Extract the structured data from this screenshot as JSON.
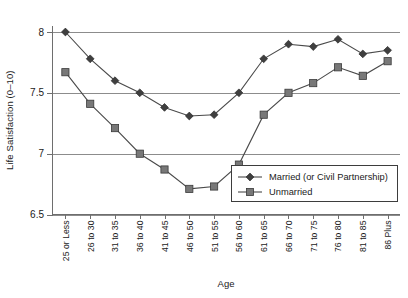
{
  "chart_data": {
    "type": "line",
    "title": "",
    "xlabel": "Age",
    "ylabel": "Life Satisfaction (0–10)",
    "categories": [
      "25 or Less",
      "26 to 30",
      "31 to 35",
      "36 to 40",
      "41 to 45",
      "46 to 50",
      "51 to 55",
      "56 to 60",
      "61 to 65",
      "66 to 70",
      "71 to 75",
      "76 to 80",
      "81 to 85",
      "86 Plus"
    ],
    "ylim": [
      6.5,
      8.0
    ],
    "yticks": [
      6.5,
      7,
      7.5,
      8
    ],
    "ytick_labels": [
      "6.5",
      "7",
      "7.5",
      "8"
    ],
    "grid": true,
    "legend_position": "bottom-right",
    "series": [
      {
        "name": "Married (or Civil Partnership)",
        "marker": "diamond",
        "color": "#3f3f3f",
        "values": [
          8.0,
          7.78,
          7.6,
          7.5,
          7.38,
          7.31,
          7.32,
          7.5,
          7.78,
          7.9,
          7.88,
          7.94,
          7.82,
          7.85
        ]
      },
      {
        "name": "Unmarried",
        "marker": "square",
        "color": "#787878",
        "values": [
          7.67,
          7.41,
          7.21,
          7.0,
          6.87,
          6.71,
          6.73,
          6.91,
          7.32,
          7.5,
          7.58,
          7.71,
          7.64,
          7.76
        ]
      }
    ]
  },
  "legend": {
    "items": [
      {
        "label": "Married (or Civil Partnership)"
      },
      {
        "label": "Unmarried"
      }
    ]
  },
  "axes": {
    "y_title": "Life Satisfaction (0–10)",
    "x_title": "Age"
  }
}
